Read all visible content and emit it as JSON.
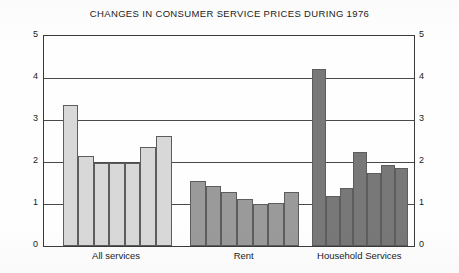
{
  "chart_data": {
    "type": "bar",
    "title": "CHANGES IN CONSUMER SERVICE PRICES DURING 1976",
    "xlabel": "",
    "ylabel": "Percent",
    "ylim": [
      0,
      5
    ],
    "yticks": [
      "0",
      "1",
      "2",
      "3",
      "4",
      "5"
    ],
    "grid": true,
    "legend": "none",
    "axis_left_ticks": [
      "5",
      "4",
      "3",
      "2",
      "1",
      "0"
    ],
    "axis_right_ticks": [
      "5",
      "4",
      "3",
      "2",
      "1",
      "0"
    ],
    "groups": [
      {
        "name": "All services",
        "color": "#d8d8d8",
        "values": [
          3.35,
          2.15,
          1.97,
          1.97,
          1.97,
          2.35,
          2.62
        ]
      },
      {
        "name": "Rent",
        "color": "#9a9a9a",
        "values": [
          1.55,
          1.42,
          1.28,
          1.12,
          1.0,
          1.03,
          1.28
        ]
      },
      {
        "name": "Household Services",
        "color": "#787878",
        "values": [
          4.22,
          1.18,
          1.37,
          2.25,
          1.75,
          1.92,
          1.85
        ]
      }
    ]
  }
}
